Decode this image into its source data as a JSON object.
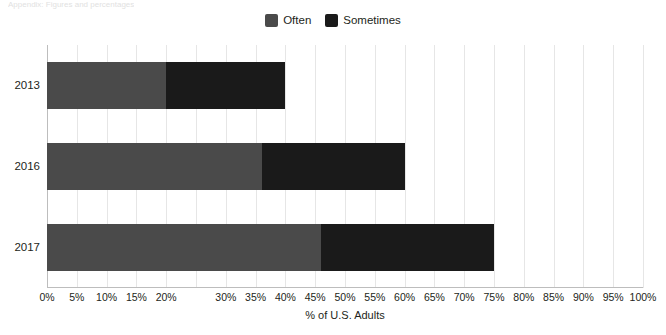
{
  "top_note": {
    "text": "Appendix: Figures and percentages"
  },
  "legend": {
    "position": "top-center",
    "items": [
      {
        "label": "Often",
        "color": "#4a4a4a",
        "key": "often"
      },
      {
        "label": "Sometimes",
        "color": "#1a1a1a",
        "key": "sometimes"
      }
    ]
  },
  "axes": {
    "x_title": "% of U.S. Adults",
    "x_ticks": [
      "0%",
      "5%",
      "10%",
      "15%",
      "20%",
      "30%",
      "35%",
      "40%",
      "45%",
      "50%",
      "55%",
      "60%",
      "65%",
      "70%",
      "75%",
      "80%",
      "85%",
      "90%",
      "95%",
      "100%"
    ],
    "x_tick_values": [
      0,
      5,
      10,
      15,
      20,
      30,
      35,
      40,
      45,
      50,
      55,
      60,
      65,
      70,
      75,
      80,
      85,
      90,
      95,
      100
    ],
    "x_min": 0,
    "x_max": 100,
    "y_categories": [
      "2013",
      "2016",
      "2017"
    ]
  },
  "chart_data": {
    "type": "bar",
    "orientation": "horizontal",
    "stacked": true,
    "title": "",
    "subtitle": "",
    "xlabel": "% of U.S. Adults",
    "ylabel": "",
    "categories": [
      "2013",
      "2016",
      "2017"
    ],
    "series": [
      {
        "name": "Often",
        "color": "#4a4a4a",
        "values": [
          20,
          36,
          46
        ]
      },
      {
        "name": "Sometimes",
        "color": "#1a1a1a",
        "values": [
          20,
          24,
          29
        ]
      }
    ],
    "totals": [
      40,
      60,
      75
    ],
    "xlim": [
      0,
      100
    ],
    "ylim": null,
    "grid": true,
    "grid_axis": "x",
    "grid_step": 5,
    "legend_position": "top-center",
    "tick_suffix": "%",
    "annotations": []
  }
}
